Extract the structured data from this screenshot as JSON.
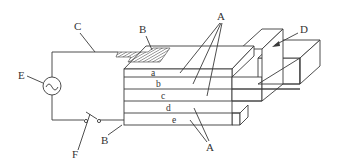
{
  "diagram": {
    "type": "schematic",
    "labels": {
      "A_top": "A",
      "A_bottom": "A",
      "B_top": "B",
      "B_bottom": "B",
      "C": "C",
      "D": "D",
      "E": "E",
      "F": "F"
    },
    "layers": [
      "a",
      "b",
      "c",
      "d",
      "e"
    ],
    "source_symbol": "~"
  }
}
